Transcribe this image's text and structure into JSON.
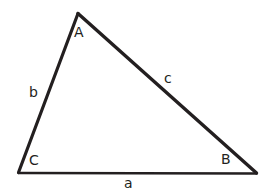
{
  "diagram": {
    "type": "triangle-geometry-diagram",
    "background_color": "#ffffff",
    "stroke_color": "#231f20",
    "text_color": "#231f20",
    "vertices": [
      {
        "name": "A",
        "label": "A",
        "x": 78,
        "y": 13,
        "role": "apex"
      },
      {
        "name": "B",
        "label": "B",
        "x": 256,
        "y": 173,
        "role": "bottom-right"
      },
      {
        "name": "C",
        "label": "C",
        "x": 18,
        "y": 173,
        "role": "bottom-left"
      }
    ],
    "sides": [
      {
        "name": "a",
        "label": "a",
        "from": "C",
        "to": "B",
        "description": "base side opposite vertex A"
      },
      {
        "name": "b",
        "label": "b",
        "from": "C",
        "to": "A",
        "description": "left side opposite vertex B"
      },
      {
        "name": "c",
        "label": "c",
        "from": "A",
        "to": "B",
        "description": "right side opposite vertex C"
      }
    ],
    "labels": {
      "vertex_A": "A",
      "vertex_B": "B",
      "vertex_C": "C",
      "side_a": "a",
      "side_b": "b",
      "side_c": "c"
    }
  }
}
